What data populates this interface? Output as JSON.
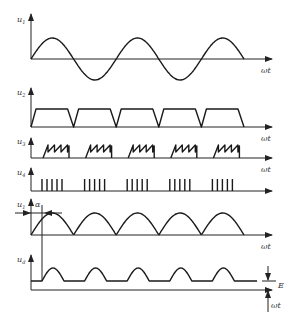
{
  "diagram": {
    "type": "waveform-timing-diagram",
    "x_axis_label": "ωt",
    "panels": [
      {
        "id": "u1",
        "ylabel": "u",
        "subscript": "1",
        "shape": "sine",
        "cycles": 2.5
      },
      {
        "id": "u2",
        "ylabel": "u",
        "subscript": "2",
        "shape": "trapezoid",
        "pulses": 5
      },
      {
        "id": "u3",
        "ylabel": "u",
        "subscript": "3",
        "shape": "sawtooth-bursts",
        "bursts": 5,
        "teeth_per_burst": 4
      },
      {
        "id": "u4",
        "ylabel": "u",
        "subscript": "4",
        "shape": "pulse-trains",
        "bursts": 5,
        "pulses_per_burst": 5
      },
      {
        "id": "u1r",
        "ylabel": "u",
        "subscript": "1",
        "shape": "full-wave-rectified-sine",
        "annotation": "α"
      },
      {
        "id": "ud",
        "ylabel": "u",
        "subscript": "d",
        "shape": "rectified-humps-over-dc",
        "annotation": "E"
      }
    ],
    "alpha_label": "α",
    "e_label": "E"
  }
}
